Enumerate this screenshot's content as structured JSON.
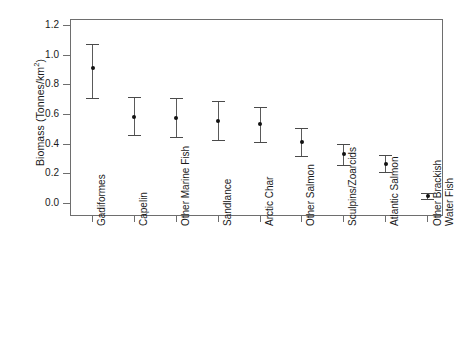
{
  "chart_data": {
    "type": "scatter",
    "title": "",
    "xlabel": "",
    "ylabel": "Biomass (Tonnes/km2)",
    "ylabel_display": "Biomass (Tonnes/km",
    "ylabel_sup": "2",
    "ylabel_tail": ")",
    "ylim": [
      0.0,
      1.25
    ],
    "yticks": [
      0.0,
      0.2,
      0.4,
      0.6,
      0.8,
      1.0,
      1.2
    ],
    "ytick_labels": [
      "0.0",
      "0.2",
      "0.4",
      "0.6",
      "0.8",
      "1.0",
      "1.2"
    ],
    "grid": false,
    "legend": null,
    "error_bars": "vertical",
    "categories": [
      "Gadiformes",
      "Capelin",
      "Other Marine Fish",
      "Sandlance",
      "Arctic Char",
      "Other Salmon",
      "Sculpins/Zoarcids",
      "Atlantic Salmon",
      "Other Brackish Water Fish"
    ],
    "category_lines": [
      [
        "Gadiformes"
      ],
      [
        "Capelin"
      ],
      [
        "Other Marine Fish"
      ],
      [
        "Sandlance"
      ],
      [
        "Arctic Char"
      ],
      [
        "Other Salmon"
      ],
      [
        "Sculpins/Zoarcids"
      ],
      [
        "Atlantic Salmon"
      ],
      [
        "Other Brackish",
        "Water Fish"
      ]
    ],
    "values": [
      0.91,
      0.58,
      0.57,
      0.55,
      0.53,
      0.41,
      0.33,
      0.26,
      0.045
    ],
    "error_low": [
      0.71,
      0.46,
      0.445,
      0.425,
      0.41,
      0.32,
      0.255,
      0.21,
      0.025
    ],
    "error_high": [
      1.07,
      0.715,
      0.705,
      0.685,
      0.65,
      0.505,
      0.4,
      0.325,
      0.065
    ],
    "colors": {
      "point": "#111111",
      "errorbar": "#5a5a5a",
      "axis": "#6e6e6e",
      "text": "#1a1a1a",
      "background": "#ffffff"
    }
  }
}
